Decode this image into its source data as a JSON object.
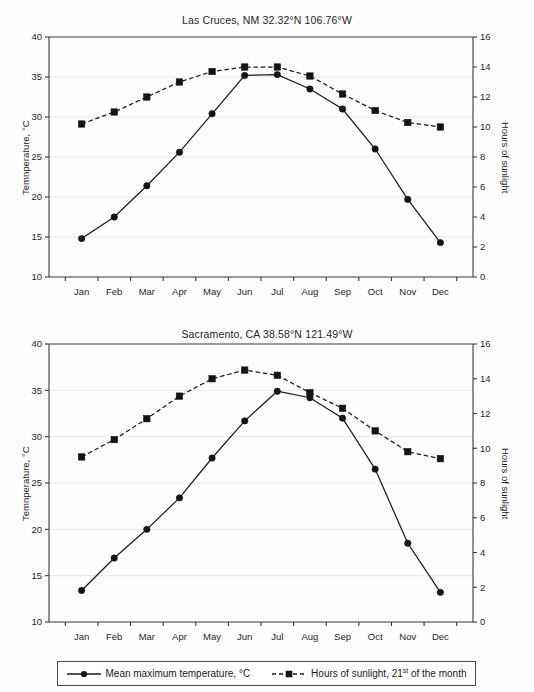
{
  "figure": {
    "background_color": "#fdfdfd",
    "line_color": "#1b1b1b",
    "gridline_color": "#e9e9e9",
    "axis_color": "#3a3a3a"
  },
  "legend": {
    "entries": [
      {
        "marker": "filled-circle-solid-line",
        "label": "Mean maximum temperature, °C"
      },
      {
        "marker": "filled-square-dashed-line",
        "label_pre": "Hours of sunlight, 21",
        "label_sup": "st",
        "label_post": " of the month"
      }
    ]
  },
  "chart_data": [
    {
      "type": "line",
      "title": "Las Cruces, NM 32.32°N 106.76°W",
      "xlabel": "",
      "ylabel": "Temnperature, °C",
      "y2label": "Hours of sunlight",
      "categories": [
        "Jan",
        "Feb",
        "Mar",
        "Apr",
        "May",
        "Jun",
        "Jul",
        "Aug",
        "Sep",
        "Oct",
        "Nov",
        "Dec"
      ],
      "ylim": [
        10,
        40
      ],
      "yticks": [
        10,
        15,
        20,
        25,
        30,
        35,
        40
      ],
      "y2lim": [
        0,
        16
      ],
      "y2ticks": [
        0,
        2,
        4,
        6,
        8,
        10,
        12,
        14,
        16
      ],
      "grid": true,
      "legend_position": "figure-bottom",
      "series": [
        {
          "name": "Mean maximum temperature, °C",
          "axis": "left",
          "marker": "circle",
          "linestyle": "solid",
          "values": [
            14.8,
            17.5,
            21.4,
            25.6,
            30.4,
            35.2,
            35.3,
            33.5,
            31.0,
            26.0,
            19.7,
            14.3
          ]
        },
        {
          "name": "Hours of sunlight, 21st of the month",
          "axis": "right",
          "marker": "square",
          "linestyle": "dashed",
          "values": [
            10.2,
            11.0,
            12.0,
            13.0,
            13.7,
            14.0,
            14.0,
            13.4,
            12.2,
            11.1,
            10.3,
            10.0
          ]
        }
      ]
    },
    {
      "type": "line",
      "title": "Sacramento, CA 38.58°N 121.49°W",
      "xlabel": "",
      "ylabel": "Temnperature, °C",
      "y2label": "Hours of sunlight",
      "categories": [
        "Jan",
        "Feb",
        "Mar",
        "Apr",
        "May",
        "Jun",
        "Jul",
        "Aug",
        "Sep",
        "Oct",
        "Nov",
        "Dec"
      ],
      "ylim": [
        10,
        40
      ],
      "yticks": [
        10,
        15,
        20,
        25,
        30,
        35,
        40
      ],
      "y2lim": [
        0,
        16
      ],
      "y2ticks": [
        0,
        2,
        4,
        6,
        8,
        10,
        12,
        14,
        16
      ],
      "grid": true,
      "legend_position": "figure-bottom",
      "series": [
        {
          "name": "Mean maximum temperature, °C",
          "axis": "left",
          "marker": "circle",
          "linestyle": "solid",
          "values": [
            13.4,
            16.9,
            20.0,
            23.4,
            27.7,
            31.7,
            34.9,
            34.2,
            32.0,
            26.5,
            18.5,
            13.2
          ]
        },
        {
          "name": "Hours of sunlight, 21st of the month",
          "axis": "right",
          "marker": "square",
          "linestyle": "dashed",
          "values": [
            9.5,
            10.5,
            11.7,
            13.0,
            14.0,
            14.5,
            14.2,
            13.2,
            12.3,
            11.0,
            9.8,
            9.4
          ]
        }
      ]
    }
  ]
}
